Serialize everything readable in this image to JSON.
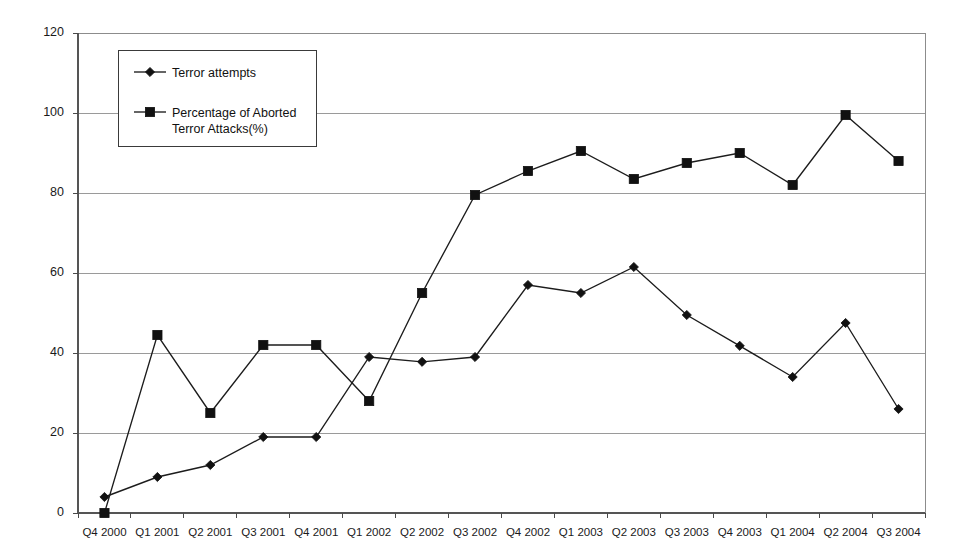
{
  "chart_data": {
    "type": "line",
    "title": "",
    "xlabel": "",
    "ylabel": "",
    "ylim": [
      0,
      120
    ],
    "ytick_step": 20,
    "yticks": [
      "0",
      "20",
      "40",
      "60",
      "80",
      "100",
      "120"
    ],
    "grid": true,
    "legend_position": "top-left-inside",
    "categories": [
      "Q4 2000",
      "Q1 2001",
      "Q2 2001",
      "Q3 2001",
      "Q4 2001",
      "Q1 2002",
      "Q2 2002",
      "Q3 2002",
      "Q4 2002",
      "Q1 2003",
      "Q2 2003",
      "Q3 2003",
      "Q4 2003",
      "Q1 2004",
      "Q2 2004",
      "Q3 2004"
    ],
    "series": [
      {
        "name": "Terror attempts",
        "marker": "diamond",
        "values": [
          4,
          9,
          12,
          19,
          19,
          39,
          37.8,
          39,
          57,
          55,
          61.5,
          49.5,
          41.8,
          34,
          47.5,
          26
        ]
      },
      {
        "name": "Percentage of Aborted Terror Attacks(%)",
        "marker": "square",
        "values": [
          0,
          44.5,
          25,
          42,
          42,
          28,
          55,
          79.5,
          85.5,
          90.5,
          83.5,
          87.5,
          90,
          82,
          99.5,
          88
        ]
      }
    ]
  },
  "legend": {
    "entries": [
      {
        "label": "Terror attempts",
        "marker": "diamond"
      },
      {
        "label": "Percentage of Aborted",
        "label2": "Terror Attacks(%)",
        "marker": "square"
      }
    ]
  },
  "colors": {
    "series": "#1c1c1c",
    "grid": "#9a9a9a",
    "axis": "#555555",
    "background": "#ffffff",
    "text": "#1a1a1a"
  }
}
